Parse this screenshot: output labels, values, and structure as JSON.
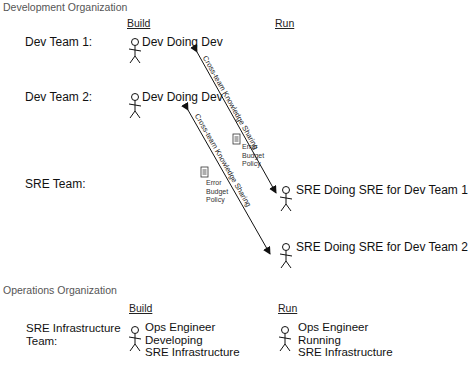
{
  "dev_org": {
    "title": "Development Organization",
    "columns": {
      "build": "Build",
      "run": "Run"
    },
    "teams": [
      {
        "label": "Dev Team 1:",
        "build_role": "Dev Doing Dev"
      },
      {
        "label": "Dev Team 2:",
        "build_role": "Dev Doing Dev"
      },
      {
        "label": "SRE Team:"
      }
    ],
    "run_roles": [
      "SRE Doing SRE for Dev Team 1",
      "SRE Doing SRE for Dev Team 2"
    ]
  },
  "links": [
    {
      "label": "Cross-team Knowledge Sharing",
      "from": "Dev Team 1 / Dev Doing Dev",
      "to": "SRE Doing SRE for Dev Team 1"
    },
    {
      "label": "Cross-team Knowledge Sharing",
      "from": "Dev Team 2 / Dev Doing Dev",
      "to": "SRE Doing SRE for Dev Team 2"
    }
  ],
  "artifacts": [
    {
      "icon": "document-icon",
      "line1": "Error",
      "line2": "Budget",
      "line3": "Policy"
    },
    {
      "icon": "document-icon",
      "line1": "Error",
      "line2": "Budget",
      "line3": "Policy"
    }
  ],
  "ops_org": {
    "title": "Operations Organization",
    "columns": {
      "build": "Build",
      "run": "Run"
    },
    "team": {
      "line1": "SRE Infrastructure",
      "line2": "Team:"
    },
    "build_role": {
      "line1": "Ops Engineer",
      "line2": "Developing",
      "line3": "SRE Infrastructure"
    },
    "run_role": {
      "line1": "Ops Engineer",
      "line2": "Running",
      "line3": "SRE Infrastructure"
    }
  }
}
